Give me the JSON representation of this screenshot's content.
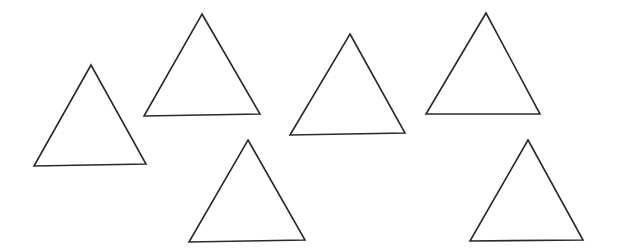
{
  "canvas": {
    "width": 617,
    "height": 252,
    "background": "#ffffff",
    "stroke_color": "#2a2a2a"
  },
  "shapes": [
    {
      "type": "triangle",
      "label": "triangle-1",
      "points": [
        [
          91,
          65
        ],
        [
          146,
          164
        ],
        [
          34,
          166
        ]
      ]
    },
    {
      "type": "triangle",
      "label": "triangle-2",
      "points": [
        [
          202,
          14
        ],
        [
          260,
          114
        ],
        [
          144,
          116
        ]
      ]
    },
    {
      "type": "triangle",
      "label": "triangle-3",
      "points": [
        [
          350,
          34
        ],
        [
          405,
          133
        ],
        [
          290,
          135
        ]
      ]
    },
    {
      "type": "triangle",
      "label": "triangle-4",
      "points": [
        [
          486,
          13
        ],
        [
          540,
          114
        ],
        [
          426,
          114
        ]
      ]
    },
    {
      "type": "triangle",
      "label": "triangle-5",
      "points": [
        [
          248,
          140
        ],
        [
          305,
          240
        ],
        [
          189,
          242
        ]
      ]
    },
    {
      "type": "triangle",
      "label": "triangle-6",
      "points": [
        [
          528,
          140
        ],
        [
          583,
          240
        ],
        [
          470,
          241
        ]
      ]
    }
  ]
}
